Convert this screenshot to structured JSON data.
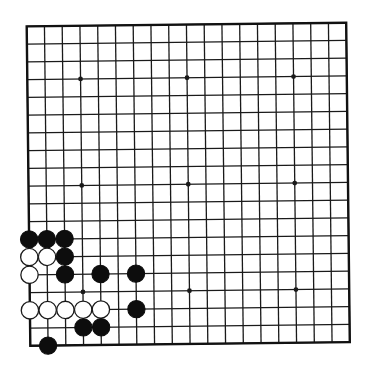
{
  "board": {
    "size": 19,
    "origin_x": 28.5,
    "origin_y": 24.5,
    "spacing": 17.75,
    "rotation_deg": -0.65,
    "line_color": "#1a1a1a",
    "border_color": "#111111",
    "background": "#ffffff",
    "star_points": [
      [
        3,
        3
      ],
      [
        9,
        3
      ],
      [
        15,
        3
      ],
      [
        3,
        9
      ],
      [
        9,
        9
      ],
      [
        15,
        9
      ],
      [
        3,
        15
      ],
      [
        9,
        15
      ],
      [
        15,
        15
      ]
    ]
  },
  "colors": {
    "black_stone": "#0d0d0d",
    "white_stone_fill": "#ffffff",
    "white_stone_stroke": "#1a1a1a"
  },
  "stones": [
    {
      "color": "black",
      "col": 0,
      "row": 12
    },
    {
      "color": "black",
      "col": 1,
      "row": 12
    },
    {
      "color": "black",
      "col": 2,
      "row": 12
    },
    {
      "color": "white",
      "col": 0,
      "row": 13
    },
    {
      "color": "white",
      "col": 1,
      "row": 13
    },
    {
      "color": "black",
      "col": 2,
      "row": 13
    },
    {
      "color": "white",
      "col": 0,
      "row": 14
    },
    {
      "color": "black",
      "col": 2,
      "row": 14
    },
    {
      "color": "black",
      "col": 4,
      "row": 14
    },
    {
      "color": "black",
      "col": 6,
      "row": 14
    },
    {
      "color": "white",
      "col": 0,
      "row": 16
    },
    {
      "color": "white",
      "col": 1,
      "row": 16
    },
    {
      "color": "white",
      "col": 2,
      "row": 16
    },
    {
      "color": "white",
      "col": 3,
      "row": 16
    },
    {
      "color": "white",
      "col": 4,
      "row": 16
    },
    {
      "color": "black",
      "col": 6,
      "row": 16
    },
    {
      "color": "black",
      "col": 3,
      "row": 17
    },
    {
      "color": "black",
      "col": 4,
      "row": 17
    },
    {
      "color": "black",
      "col": 1,
      "row": 18
    }
  ]
}
